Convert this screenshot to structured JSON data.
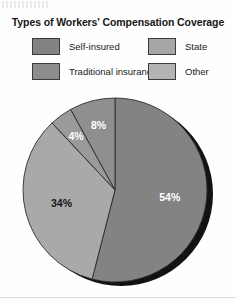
{
  "page": {
    "background_color": "#fefefe",
    "top_artifact_note": ""
  },
  "chart_title": "Types of Workers' Compensation Coverage",
  "legend": {
    "items": [
      {
        "label": "Self-insured",
        "color": "#838383"
      },
      {
        "label": "State",
        "color": "#a6a6a6"
      },
      {
        "label": "Traditional insurance",
        "color": "#8d8d8d"
      },
      {
        "label": "Other",
        "color": "#b4b4b4"
      }
    ]
  },
  "labels": {
    "p54": "54%",
    "p34": "34%",
    "p8": "8%",
    "p4": "4%"
  },
  "chart_data": {
    "type": "pie",
    "title": "Types of Workers' Compensation Coverage",
    "xlabel": "",
    "ylabel": "",
    "unit": "percent",
    "start_angle_deg": 0,
    "direction": "clockwise",
    "legend_position": "top",
    "grid": false,
    "categories": [
      "Self-insured",
      "Traditional insurance",
      "State",
      "Other"
    ],
    "values": [
      54,
      34,
      4,
      8
    ],
    "slices": [
      {
        "label": "Self-insured",
        "value": 54,
        "display": "54%",
        "color": "#838383",
        "label_color": "#ffffff"
      },
      {
        "label": "Traditional insurance",
        "value": 34,
        "display": "34%",
        "color": "#a9a9a9",
        "label_color": "#161616"
      },
      {
        "label": "State",
        "value": 4,
        "display": "4%",
        "color": "#9a9a9a",
        "label_color": "#ffffff"
      },
      {
        "label": "Other",
        "value": 8,
        "display": "8%",
        "color": "#8f8f8f",
        "label_color": "#ffffff"
      }
    ],
    "total": 100,
    "shadow_color": "#121212"
  }
}
